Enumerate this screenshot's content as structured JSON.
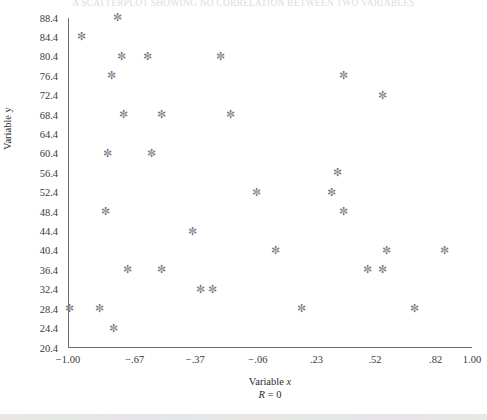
{
  "chart_title": "A SCATTERPLOT SHOWING NO CORRELATION BETWEEN TWO VARIABLES",
  "axes": {
    "y_title": "Variable y",
    "x_title_prefix": "Variable ",
    "x_title_var": "x",
    "annotation_prefix": "R",
    "annotation_rest": " = 0",
    "y_ticks": [
      "88.4",
      "84.4",
      "80.4",
      "76.4",
      "72.4",
      "68.4",
      "64.4",
      "60.4",
      "56.4",
      "52.4",
      "48.4",
      "44.4",
      "40.4",
      "36.4",
      "32.4",
      "28.4",
      "24.4",
      "20.4"
    ],
    "x_ticks": [
      "−1.00",
      "−.67",
      "−.37",
      "−.06",
      ".23",
      ".52",
      ".82",
      "1.00"
    ],
    "marker_glyph": "✼",
    "marker_color": "#7a7a85",
    "axis_color": "#6e6e6e"
  },
  "chart_data": {
    "type": "scatter",
    "title": "A SCATTERPLOT SHOWING NO CORRELATION BETWEEN TWO VARIABLES",
    "xlabel": "Variable x",
    "ylabel": "Variable y",
    "annotation": "R = 0",
    "grid": false,
    "legend": "none",
    "xlim": [
      -1.0,
      1.0
    ],
    "ylim": [
      20.4,
      88.4
    ],
    "x_tick_values": [
      -1.0,
      -0.67,
      -0.37,
      -0.06,
      0.23,
      0.52,
      0.82,
      1.0
    ],
    "x_tick_labels": [
      "−1.00",
      "−.67",
      "−.37",
      "−.06",
      ".23",
      ".52",
      ".82",
      "1.00"
    ],
    "y_tick_values": [
      88.4,
      84.4,
      80.4,
      76.4,
      72.4,
      68.4,
      64.4,
      60.4,
      56.4,
      52.4,
      48.4,
      44.4,
      40.4,
      36.4,
      32.4,
      28.4,
      24.4,
      20.4
    ],
    "series": [
      {
        "name": "observations",
        "marker": "asterisk",
        "color": "#7a7a85",
        "points": [
          [
            -0.76,
            88.4
          ],
          [
            -0.94,
            84.4
          ],
          [
            -0.74,
            80.4
          ],
          [
            -0.61,
            80.4
          ],
          [
            -0.25,
            80.4
          ],
          [
            -0.79,
            76.4
          ],
          [
            0.36,
            76.4
          ],
          [
            0.55,
            72.4
          ],
          [
            -0.73,
            68.4
          ],
          [
            -0.54,
            68.4
          ],
          [
            -0.2,
            68.4
          ],
          [
            -0.81,
            60.4
          ],
          [
            -0.59,
            60.4
          ],
          [
            0.33,
            56.4
          ],
          [
            0.3,
            52.4
          ],
          [
            -0.07,
            52.4
          ],
          [
            -0.82,
            48.4
          ],
          [
            0.36,
            48.4
          ],
          [
            -0.39,
            44.4
          ],
          [
            0.02,
            40.4
          ],
          [
            0.57,
            40.4
          ],
          [
            0.86,
            40.4
          ],
          [
            -0.71,
            36.4
          ],
          [
            -0.54,
            36.4
          ],
          [
            0.48,
            36.4
          ],
          [
            0.55,
            36.4
          ],
          [
            -0.35,
            32.4
          ],
          [
            -0.29,
            32.4
          ],
          [
            -1.0,
            28.4
          ],
          [
            -0.85,
            28.4
          ],
          [
            0.15,
            28.4
          ],
          [
            0.71,
            28.4
          ],
          [
            -0.78,
            24.4
          ]
        ]
      }
    ]
  }
}
